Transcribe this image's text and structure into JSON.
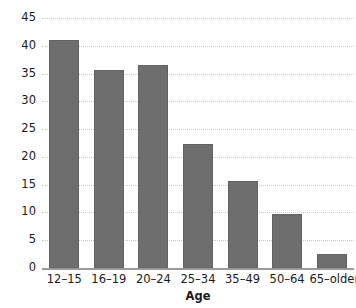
{
  "chart_data": {
    "type": "bar",
    "title": "",
    "xlabel": "Age",
    "ylabel": "",
    "categories": [
      "12–15",
      "16–19",
      "20–24",
      "25–34",
      "35–49",
      "50–64",
      "65–older"
    ],
    "values": [
      41,
      35.7,
      36.5,
      22.3,
      15.6,
      9.8,
      2.5
    ],
    "ylim": [
      0,
      45
    ],
    "ytick_labels": [
      "0",
      "5",
      "10",
      "15",
      "20",
      "25",
      "30",
      "35",
      "40",
      "45"
    ],
    "ytick_values": [
      0,
      5,
      10,
      15,
      20,
      25,
      30,
      35,
      40,
      45
    ],
    "grid": true,
    "grid_style": "dotted",
    "legend": "none",
    "bar_color": "#6e6e6e",
    "grid_color": "#c9c9c9",
    "axis_color": "#9a9a9a"
  }
}
